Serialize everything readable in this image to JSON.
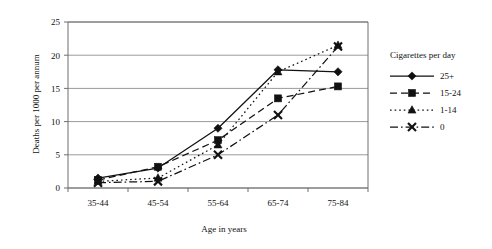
{
  "chart_data": {
    "type": "line",
    "title": "",
    "xlabel": "Age in years",
    "ylabel": "Deaths per 1000 per annum",
    "categories": [
      "35-44",
      "45-54",
      "55-64",
      "65-74",
      "75-84"
    ],
    "ylim": [
      0,
      25
    ],
    "yticks": [
      0,
      5,
      10,
      15,
      20,
      25
    ],
    "ytick_labels": [
      "0",
      "5",
      "10",
      "15",
      "20",
      "25"
    ],
    "grid": "horizontal",
    "legend_position": "right",
    "legend_title": "Cigarettes per day",
    "series": [
      {
        "name": "25+",
        "marker": "diamond",
        "line_style": "solid",
        "values": [
          1.5,
          3.0,
          9.0,
          17.8,
          17.5
        ]
      },
      {
        "name": "15-24",
        "marker": "square",
        "line_style": "dashed",
        "values": [
          1.2,
          3.2,
          7.2,
          13.5,
          15.3
        ]
      },
      {
        "name": "1-14",
        "marker": "triangle",
        "line_style": "dotted",
        "values": [
          1.0,
          1.5,
          6.5,
          17.5,
          21.5
        ]
      },
      {
        "name": "0",
        "marker": "cross",
        "line_style": "dashdot",
        "values": [
          0.8,
          1.0,
          5.0,
          11.0,
          21.3
        ]
      }
    ]
  },
  "colors": {
    "ink": "#111111",
    "grid": "#9a9a9a",
    "axis": "#6f6f6f",
    "background": "#ffffff"
  }
}
